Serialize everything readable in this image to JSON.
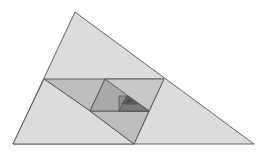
{
  "diagram": {
    "background": "#ffffff",
    "stroke": "#555555",
    "shapes": [
      {
        "name": "outer-triangle",
        "points": "75,12 13,144 254,144",
        "fill": "#dcdcdc"
      },
      {
        "name": "parallelogram-1",
        "points": "44,79 164,79 134,144 90,111",
        "fill": "#bdbdbd"
      },
      {
        "name": "parallelogram-1b",
        "points": "44,79 90,111 134,144 13,144",
        "fill": "#dcdcdc"
      },
      {
        "name": "parallelogram-2",
        "points": "105,79 164,79 149,111 90,111",
        "fill": "#c8c8c8"
      },
      {
        "name": "lower-band",
        "points": "90,111 149,111 134,144",
        "fill": "#bdbdbd"
      },
      {
        "name": "triangle-2",
        "points": "105,79 90,111 149,111",
        "fill": "#a9a9a9"
      },
      {
        "name": "parallelogram-3",
        "points": "119,96 127,96 149,111 119,111",
        "fill": "#8f8f8f"
      },
      {
        "name": "triangle-3",
        "points": "127,96 119,111 149,111",
        "fill": "#7a7a7a"
      },
      {
        "name": "triangle-4",
        "points": "127,96 122,104 137,104",
        "fill": "#5e5e5e"
      },
      {
        "name": "triangle-5",
        "points": "129,99 126,102 132,102",
        "fill": "#3e3e3e"
      }
    ]
  }
}
